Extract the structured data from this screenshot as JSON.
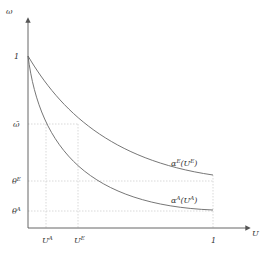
{
  "diagram": {
    "type": "economic-curve-diagram",
    "axes": {
      "y_label": "ω",
      "x_label": "U",
      "y_ticks": [
        {
          "label": "1",
          "y": 56
        },
        {
          "label": "ω̄",
          "y": 124
        },
        {
          "label": "θ",
          "sup": "E",
          "y": 181
        },
        {
          "label": "θ",
          "sup": "A",
          "y": 211
        }
      ],
      "x_ticks": [
        {
          "label": "U",
          "sup": "A",
          "x": 46
        },
        {
          "label": "U",
          "sup": "E",
          "x": 78
        },
        {
          "label": "1",
          "x": 213
        }
      ]
    },
    "curves": [
      {
        "name": "alpha-E",
        "label": "α",
        "label_sup": "E",
        "arg": "(U",
        "arg_sup": "E",
        "arg_close": ")"
      },
      {
        "name": "alpha-A",
        "label": "α",
        "label_sup": "A",
        "arg": "(U",
        "arg_sup": "A",
        "arg_close": ")"
      }
    ],
    "colors": {
      "axis": "#555555",
      "curve": "#666666",
      "guide": "#cccccc",
      "text": "#333333"
    }
  }
}
